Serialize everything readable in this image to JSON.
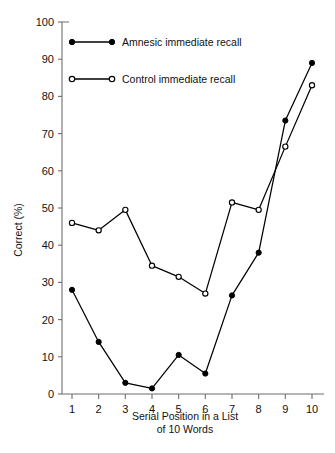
{
  "chart_data": {
    "type": "line",
    "title": "",
    "xlabel": "Serial Position in a List of 10 Words",
    "xlabel_line1": "Serial Position in a List",
    "xlabel_line2": "of 10 Words",
    "ylabel": "Correct (%)",
    "x": [
      1,
      2,
      3,
      4,
      5,
      6,
      7,
      8,
      9,
      10
    ],
    "xticklabels": [
      "1",
      "2",
      "3",
      "4",
      "5",
      "6",
      "7",
      "8",
      "9",
      "10"
    ],
    "yticklabels": [
      "0",
      "10",
      "20",
      "30",
      "40",
      "50",
      "60",
      "70",
      "80",
      "90",
      "100"
    ],
    "yticks": [
      0,
      10,
      20,
      30,
      40,
      50,
      60,
      70,
      80,
      90,
      100
    ],
    "xlim": [
      0.6,
      10.6
    ],
    "ylim": [
      0,
      100
    ],
    "grid": false,
    "legend_position": "upper left",
    "series": [
      {
        "name": "Amnesic immediate recall",
        "marker": "filled-circle",
        "color": "#000000",
        "values": [
          28,
          14,
          3,
          1.5,
          10.5,
          5.5,
          26.5,
          38,
          73.5,
          89
        ]
      },
      {
        "name": "Control immediate recall",
        "marker": "open-circle",
        "color": "#000000",
        "values": [
          46,
          44,
          49.5,
          34.5,
          31.5,
          27,
          51.5,
          49.5,
          66.5,
          83
        ]
      }
    ]
  },
  "legend": {
    "entries": [
      {
        "label": "Amnesic immediate recall",
        "marker": "filled-circle"
      },
      {
        "label": "Control immediate recall",
        "marker": "open-circle"
      }
    ]
  }
}
